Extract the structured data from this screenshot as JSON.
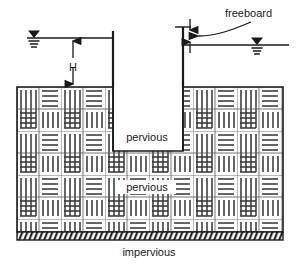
{
  "figure": {
    "type": "engineering-cross-section",
    "background_color": "#ffffff",
    "line_color": "#1a1a1a",
    "hatch_color": "#333333",
    "soil_fill_color": "#ffffff"
  },
  "labels": {
    "head": "H",
    "freeboard": "freeboard",
    "pervious_upper": "pervious",
    "pervious_lower": "pervious",
    "impervious": "impervious"
  },
  "geometry": {
    "canvas": {
      "width": 298,
      "height": 265
    },
    "soil_block": {
      "left": 17,
      "right": 283,
      "top": 87,
      "bottom": 232
    },
    "trench": {
      "left": 113,
      "right": 183,
      "bottom": 151
    },
    "wall_left_x": 113,
    "wall_right_x": 183,
    "wall_left_top_y": 31,
    "wall_right_top_y": 27,
    "water_level_left_y": 38,
    "water_level_right_y": 45,
    "water_line_left_start_x": 27,
    "water_line_right_end_x": 289,
    "impervious_band": {
      "top": 232,
      "bottom": 240
    },
    "hatch_cell_size": 22
  },
  "annotations": {
    "head_dimension": {
      "label": "H",
      "from_y": 38,
      "to_y": 87,
      "x": 73,
      "arrow_style": "double-headed",
      "meaning": "head of water above ground surface"
    },
    "freeboard_dimension": {
      "label": "freeboard",
      "from_y": 27,
      "to_y": 45,
      "x": 190,
      "arrow_style": "double-headed",
      "meaning": "vertical distance from crest to downstream water surface"
    },
    "water_surface_symbols": [
      {
        "name": "upstream-water-level",
        "x": 34,
        "y": 38
      },
      {
        "name": "downstream-water-level",
        "x": 257,
        "y": 45
      }
    ],
    "soil_layers": [
      {
        "name": "pervious-upper",
        "label": "pervious",
        "x": 146,
        "y": 140
      },
      {
        "name": "pervious-lower",
        "label": "pervious",
        "x": 146,
        "y": 190
      },
      {
        "name": "impervious-base",
        "label": "impervious",
        "x": 149,
        "y": 252
      }
    ]
  }
}
